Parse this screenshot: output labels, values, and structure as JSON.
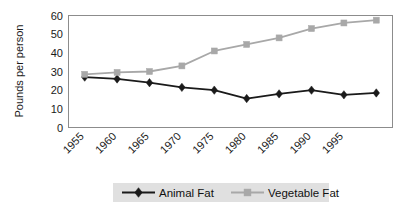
{
  "chart_data": {
    "type": "line",
    "title": "",
    "xlabel": "",
    "ylabel": "Pounds per person",
    "ylim": [
      0,
      60
    ],
    "yticks": [
      0,
      10,
      20,
      30,
      40,
      50,
      60
    ],
    "ytick_labels": [
      "0",
      "10",
      "20",
      "30",
      "40",
      "50",
      "60"
    ],
    "categories": [
      "1955",
      "1960",
      "1965",
      "1970",
      "1975",
      "1980",
      "1985",
      "1990",
      "1995",
      ""
    ],
    "xtick_labels": [
      "1955",
      "1960",
      "1965",
      "1970",
      "1975",
      "1980",
      "1985",
      "1990",
      "1995"
    ],
    "grid": false,
    "legend_position": "bottom",
    "series": [
      {
        "name": "Animal Fat",
        "marker": "diamond",
        "color": "#1a1a1a",
        "values": [
          27,
          26,
          24,
          21.5,
          20,
          15.5,
          18,
          20,
          17.5,
          18.5
        ]
      },
      {
        "name": "Vegetable Fat",
        "marker": "square",
        "color": "#a8a8a8",
        "values": [
          28.5,
          29.5,
          30,
          33,
          41,
          44.5,
          48,
          53,
          56,
          57.5
        ]
      }
    ]
  },
  "legend": {
    "items": [
      {
        "label": "Animal Fat",
        "marker": "diamond-marker",
        "color": "#1a1a1a"
      },
      {
        "label": "Vegetable Fat",
        "marker": "square-marker",
        "color": "#a8a8a8"
      }
    ]
  },
  "axes": {
    "y_title": "Pounds per person"
  }
}
